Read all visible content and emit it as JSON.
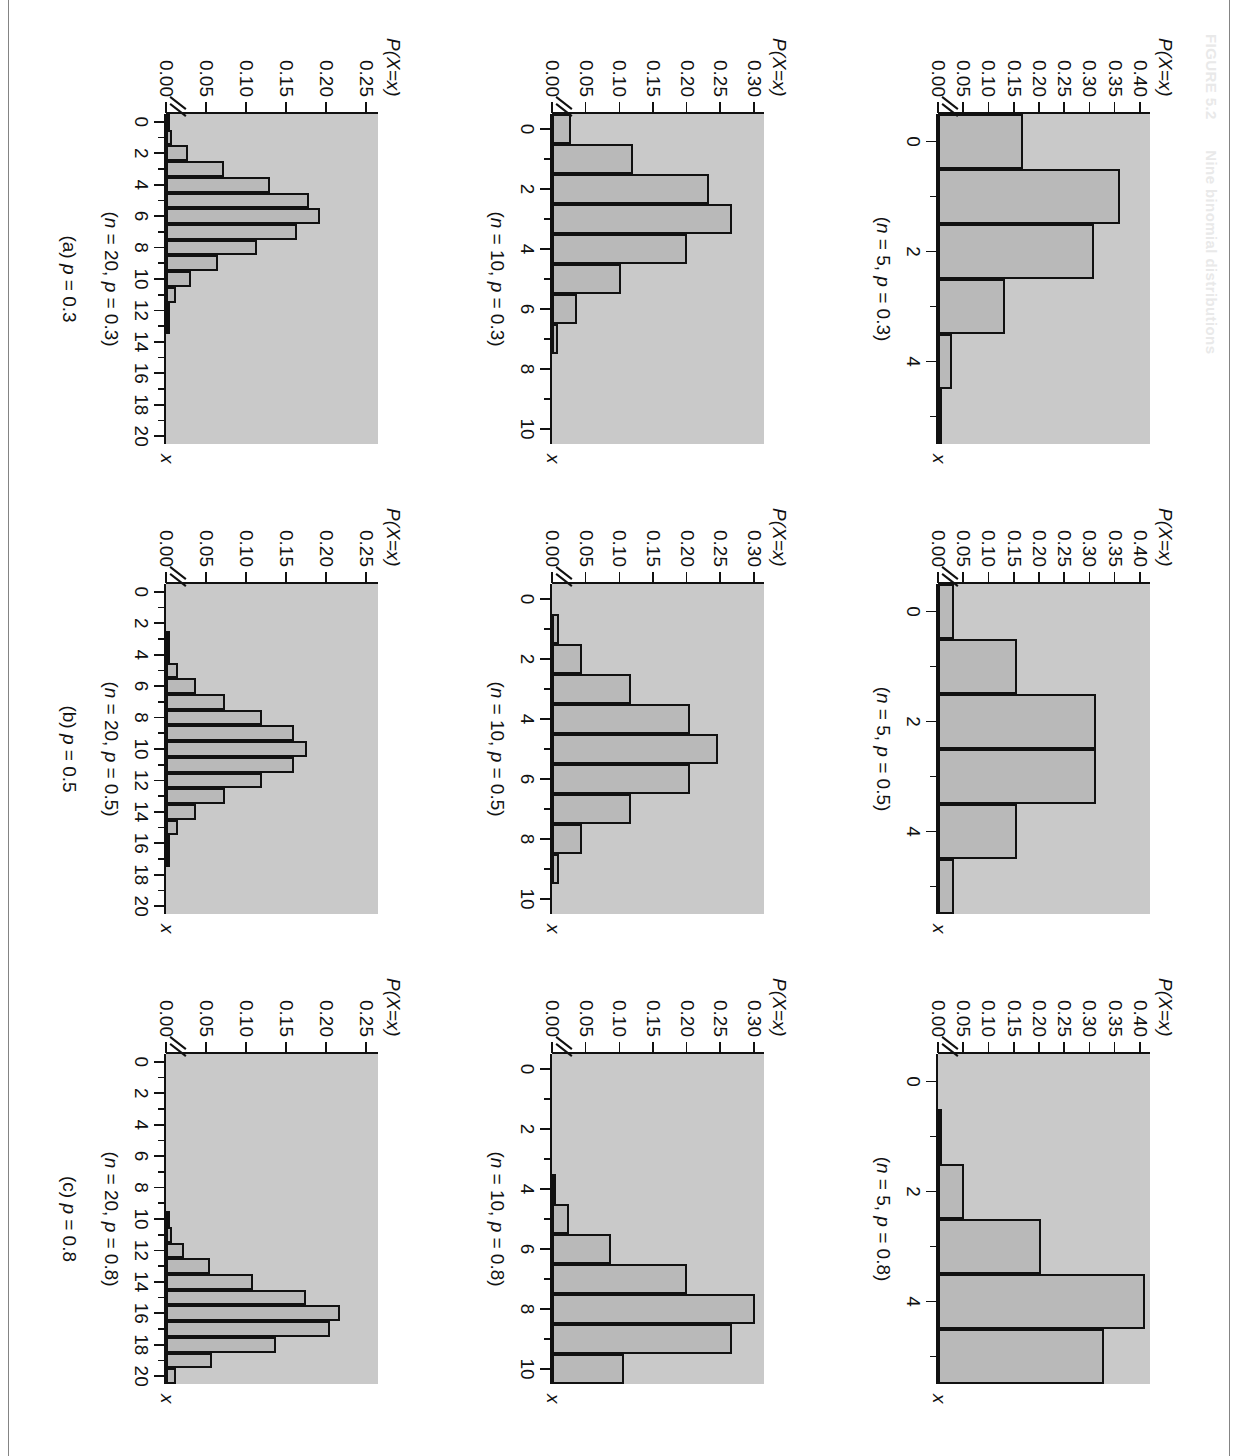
{
  "figure": {
    "number": "FIGURE 5.2",
    "title": "Nine binomial distributions"
  },
  "axis_titles": {
    "y": "P(X=x)",
    "x": "x"
  },
  "column_captions": [
    "(a) p = 0.3",
    "(b) p = 0.5",
    "(c) p = 0.8"
  ],
  "colors": {
    "plot_background": "#c9c9c9",
    "bar_fill": "#b9b9b9",
    "bar_stroke": "#111111",
    "page_background": "#ffffff"
  },
  "chart_data": [
    {
      "id": "n5-p03",
      "type": "bar",
      "title": "(n = 5, p = 0.3)",
      "xlabel": "x",
      "ylabel": "P(X=x)",
      "n": 5,
      "p": 0.3,
      "categories": [
        0,
        1,
        2,
        3,
        4,
        5
      ],
      "values": [
        0.168,
        0.36,
        0.309,
        0.132,
        0.028,
        0.002
      ],
      "xticks": [
        0,
        2,
        4
      ],
      "xticks_all": [
        0,
        1,
        2,
        3,
        4,
        5
      ],
      "yticks": [
        "0.00",
        "0.05",
        "0.10",
        "0.15",
        "0.20",
        "0.25",
        "0.30",
        "0.35",
        "0.40"
      ],
      "ylim": [
        0,
        0.42
      ],
      "xlim": [
        -0.5,
        5.5
      ],
      "axis_break": true,
      "grid": false
    },
    {
      "id": "n5-p05",
      "type": "bar",
      "title": "(n = 5, p = 0.5)",
      "xlabel": "x",
      "ylabel": "P(X=x)",
      "n": 5,
      "p": 0.5,
      "categories": [
        0,
        1,
        2,
        3,
        4,
        5
      ],
      "values": [
        0.031,
        0.156,
        0.313,
        0.313,
        0.156,
        0.031
      ],
      "xticks": [
        0,
        2,
        4
      ],
      "xticks_all": [
        0,
        1,
        2,
        3,
        4,
        5
      ],
      "yticks": [
        "0.00",
        "0.05",
        "0.10",
        "0.15",
        "0.20",
        "0.25",
        "0.30",
        "0.35",
        "0.40"
      ],
      "ylim": [
        0,
        0.42
      ],
      "xlim": [
        -0.5,
        5.5
      ],
      "axis_break": true,
      "grid": false
    },
    {
      "id": "n5-p08",
      "type": "bar",
      "title": "(n = 5, p = 0.8)",
      "xlabel": "x",
      "ylabel": "P(X=x)",
      "n": 5,
      "p": 0.8,
      "categories": [
        0,
        1,
        2,
        3,
        4,
        5
      ],
      "values": [
        0.0,
        0.006,
        0.051,
        0.205,
        0.41,
        0.328
      ],
      "xticks": [
        0,
        2,
        4
      ],
      "xticks_all": [
        0,
        1,
        2,
        3,
        4,
        5
      ],
      "yticks": [
        "0.00",
        "0.05",
        "0.10",
        "0.15",
        "0.20",
        "0.25",
        "0.30",
        "0.35",
        "0.40"
      ],
      "ylim": [
        0,
        0.42
      ],
      "xlim": [
        -0.5,
        5.5
      ],
      "axis_break": true,
      "grid": false
    },
    {
      "id": "n10-p03",
      "type": "bar",
      "title": "(n = 10, p = 0.3)",
      "xlabel": "x",
      "ylabel": "P(X=x)",
      "n": 10,
      "p": 0.3,
      "categories": [
        0,
        1,
        2,
        3,
        4,
        5,
        6,
        7,
        8,
        9,
        10
      ],
      "values": [
        0.028,
        0.121,
        0.233,
        0.267,
        0.2,
        0.103,
        0.037,
        0.009,
        0.001,
        0.0,
        0.0
      ],
      "xticks": [
        0,
        2,
        4,
        6,
        8,
        10
      ],
      "xticks_all": [
        0,
        1,
        2,
        3,
        4,
        5,
        6,
        7,
        8,
        9,
        10
      ],
      "yticks": [
        "0.00",
        "0.05",
        "0.10",
        "0.15",
        "0.20",
        "0.25",
        "0.30"
      ],
      "ylim": [
        0,
        0.315
      ],
      "xlim": [
        -0.5,
        10.5
      ],
      "axis_break": true,
      "grid": false
    },
    {
      "id": "n10-p05",
      "type": "bar",
      "title": "(n = 10, p = 0.5)",
      "xlabel": "x",
      "ylabel": "P(X=x)",
      "n": 10,
      "p": 0.5,
      "categories": [
        0,
        1,
        2,
        3,
        4,
        5,
        6,
        7,
        8,
        9,
        10
      ],
      "values": [
        0.001,
        0.01,
        0.044,
        0.117,
        0.205,
        0.246,
        0.205,
        0.117,
        0.044,
        0.01,
        0.001
      ],
      "xticks": [
        0,
        2,
        4,
        6,
        8,
        10
      ],
      "xticks_all": [
        0,
        1,
        2,
        3,
        4,
        5,
        6,
        7,
        8,
        9,
        10
      ],
      "yticks": [
        "0.00",
        "0.05",
        "0.10",
        "0.15",
        "0.20",
        "0.25",
        "0.30"
      ],
      "ylim": [
        0,
        0.315
      ],
      "xlim": [
        -0.5,
        10.5
      ],
      "axis_break": true,
      "grid": false
    },
    {
      "id": "n10-p08",
      "type": "bar",
      "title": "(n = 10, p = 0.8)",
      "xlabel": "x",
      "ylabel": "P(X=x)",
      "n": 10,
      "p": 0.8,
      "categories": [
        0,
        1,
        2,
        3,
        4,
        5,
        6,
        7,
        8,
        9,
        10
      ],
      "values": [
        0.0,
        0.0,
        0.0,
        0.001,
        0.006,
        0.026,
        0.088,
        0.201,
        0.302,
        0.268,
        0.107
      ],
      "xticks": [
        0,
        2,
        4,
        6,
        8,
        10
      ],
      "xticks_all": [
        0,
        1,
        2,
        3,
        4,
        5,
        6,
        7,
        8,
        9,
        10
      ],
      "yticks": [
        "0.00",
        "0.05",
        "0.10",
        "0.15",
        "0.20",
        "0.25",
        "0.30"
      ],
      "ylim": [
        0,
        0.315
      ],
      "xlim": [
        -0.5,
        10.5
      ],
      "axis_break": true,
      "grid": false
    },
    {
      "id": "n20-p03",
      "type": "bar",
      "title": "(n = 20, p = 0.3)",
      "xlabel": "x",
      "ylabel": "P(X=x)",
      "n": 20,
      "p": 0.3,
      "categories": [
        0,
        1,
        2,
        3,
        4,
        5,
        6,
        7,
        8,
        9,
        10,
        11,
        12,
        13,
        14,
        15,
        16,
        17,
        18,
        19,
        20
      ],
      "values": [
        0.001,
        0.007,
        0.028,
        0.072,
        0.13,
        0.179,
        0.192,
        0.164,
        0.114,
        0.065,
        0.031,
        0.012,
        0.004,
        0.001,
        0.0,
        0.0,
        0.0,
        0.0,
        0.0,
        0.0,
        0.0
      ],
      "xticks": [
        0,
        2,
        4,
        6,
        8,
        10,
        12,
        14,
        16,
        18,
        20
      ],
      "xticks_all": [
        0,
        1,
        2,
        3,
        4,
        5,
        6,
        7,
        8,
        9,
        10,
        11,
        12,
        13,
        14,
        15,
        16,
        17,
        18,
        19,
        20
      ],
      "yticks": [
        "0.00",
        "0.05",
        "0.10",
        "0.15",
        "0.20",
        "0.25"
      ],
      "ylim": [
        0,
        0.265
      ],
      "xlim": [
        -0.5,
        20.5
      ],
      "axis_break": true,
      "grid": false
    },
    {
      "id": "n20-p05",
      "type": "bar",
      "title": "(n = 20, p = 0.5)",
      "xlabel": "x",
      "ylabel": "P(X=x)",
      "n": 20,
      "p": 0.5,
      "categories": [
        0,
        1,
        2,
        3,
        4,
        5,
        6,
        7,
        8,
        9,
        10,
        11,
        12,
        13,
        14,
        15,
        16,
        17,
        18,
        19,
        20
      ],
      "values": [
        0.0,
        0.0,
        0.0,
        0.001,
        0.005,
        0.015,
        0.037,
        0.074,
        0.12,
        0.16,
        0.176,
        0.16,
        0.12,
        0.074,
        0.037,
        0.015,
        0.005,
        0.001,
        0.0,
        0.0,
        0.0
      ],
      "xticks": [
        0,
        2,
        4,
        6,
        8,
        10,
        12,
        14,
        16,
        18,
        20
      ],
      "xticks_all": [
        0,
        1,
        2,
        3,
        4,
        5,
        6,
        7,
        8,
        9,
        10,
        11,
        12,
        13,
        14,
        15,
        16,
        17,
        18,
        19,
        20
      ],
      "yticks": [
        "0.00",
        "0.05",
        "0.10",
        "0.15",
        "0.20",
        "0.25"
      ],
      "ylim": [
        0,
        0.265
      ],
      "xlim": [
        -0.5,
        20.5
      ],
      "axis_break": true,
      "grid": false
    },
    {
      "id": "n20-p08",
      "type": "bar",
      "title": "(n = 20, p = 0.8)",
      "xlabel": "x",
      "ylabel": "P(X=x)",
      "n": 20,
      "p": 0.8,
      "categories": [
        0,
        1,
        2,
        3,
        4,
        5,
        6,
        7,
        8,
        9,
        10,
        11,
        12,
        13,
        14,
        15,
        16,
        17,
        18,
        19,
        20
      ],
      "values": [
        0.0,
        0.0,
        0.0,
        0.0,
        0.0,
        0.0,
        0.0,
        0.0,
        0.0,
        0.0,
        0.002,
        0.007,
        0.022,
        0.055,
        0.109,
        0.175,
        0.218,
        0.205,
        0.137,
        0.058,
        0.012
      ],
      "xticks": [
        0,
        2,
        4,
        6,
        8,
        10,
        12,
        14,
        16,
        18,
        20
      ],
      "xticks_all": [
        0,
        1,
        2,
        3,
        4,
        5,
        6,
        7,
        8,
        9,
        10,
        11,
        12,
        13,
        14,
        15,
        16,
        17,
        18,
        19,
        20
      ],
      "yticks": [
        "0.00",
        "0.05",
        "0.10",
        "0.15",
        "0.20",
        "0.25"
      ],
      "ylim": [
        0,
        0.265
      ],
      "xlim": [
        -0.5,
        20.5
      ],
      "axis_break": true,
      "grid": false
    }
  ]
}
